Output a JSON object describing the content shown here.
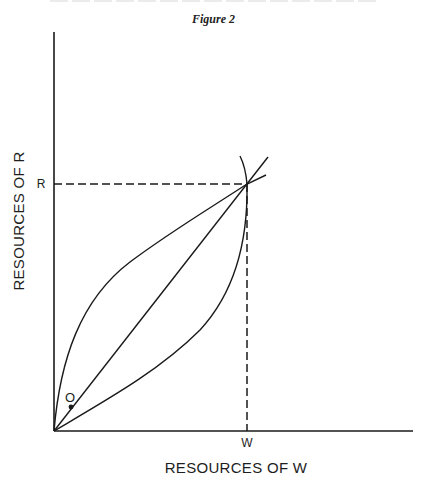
{
  "figure": {
    "title": "Figure 2"
  },
  "axes": {
    "x_label": "RESOURCES OF W",
    "y_label": "RESOURCES OF R",
    "x_tick": "W",
    "y_tick": "R"
  },
  "points": {
    "origin_point_label": "O"
  },
  "colors": {
    "ink": "#1a1a1a",
    "background": "#ffffff"
  },
  "diagram": {
    "type": "economic resource allocation diagram",
    "elements": [
      "vertical axis (Resources of R)",
      "horizontal axis (Resources of W)",
      "dashed horizontal line from R to intersection",
      "dashed vertical line from W to intersection",
      "straight diagonal line from origin through intersection",
      "concave upper curve from origin to intersection",
      "convex lower curve from origin to intersection, continuing as arc above",
      "point O marked near origin on diagonal"
    ]
  }
}
